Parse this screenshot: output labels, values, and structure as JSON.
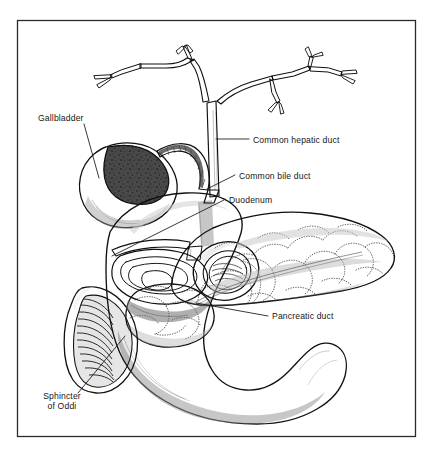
{
  "figure": {
    "kind": "anatomical-illustration",
    "style": "black-and-white pen-and-ink medical drawing with grayscale shading",
    "background_color": "#ffffff",
    "frame_color": "#2a2a2a",
    "ink_color": "#101010",
    "text_color": "#161616"
  },
  "labels": [
    {
      "id": "gallbladder",
      "text": "Gallbladder",
      "name": "label-gallbladder",
      "x": 38,
      "y": 121,
      "anchor": "start",
      "leader_from": [
        84,
        124
      ],
      "leader_to": [
        99,
        178
      ]
    },
    {
      "id": "common_hepatic_duct",
      "text": "Common hepatic duct",
      "name": "label-common-hepatic-duct",
      "x": 253,
      "y": 143,
      "anchor": "start",
      "leader_from": [
        249,
        139
      ],
      "leader_to": [
        216,
        139
      ]
    },
    {
      "id": "common_bile_duct",
      "text": "Common bile duct",
      "name": "label-common-bile-duct",
      "x": 239,
      "y": 179,
      "anchor": "start",
      "leader_from": [
        235,
        175
      ],
      "leader_to": [
        207,
        189
      ]
    },
    {
      "id": "duodenum",
      "text": "Duodenum",
      "name": "label-duodenum",
      "x": 229,
      "y": 203,
      "anchor": "start",
      "leader_from": [
        224,
        200
      ],
      "leader_to": [
        112,
        256
      ]
    },
    {
      "id": "pancreatic_duct",
      "text": "Pancreatic duct",
      "name": "label-pancreatic-duct",
      "x": 272,
      "y": 319,
      "anchor": "start",
      "leader_from": [
        268,
        316
      ],
      "leader_to": [
        196,
        303
      ]
    },
    {
      "id": "sphincter_of_oddi",
      "text": "Sphincter",
      "text_line2": "of Oddi",
      "name": "label-sphincter-of-oddi",
      "x": 62,
      "y": 399,
      "x2": 62,
      "y2": 409,
      "anchor": "middle",
      "leader_from": [
        78,
        393
      ],
      "leader_to": [
        125,
        336
      ]
    }
  ],
  "structures": [
    {
      "id": "hepatic-duct-tree",
      "name": "hepatic-duct-tree",
      "description": "Branching intrahepatic bile ducts converging to the common hepatic duct"
    },
    {
      "id": "gallbladder-body",
      "name": "gallbladder-body",
      "description": "Pear-shaped gallbladder, cut open to show dark granular interior"
    },
    {
      "id": "cystic-duct",
      "name": "cystic-duct",
      "description": "Curved cystic duct with spiral valves of Heister"
    },
    {
      "id": "common-bile-duct-tube",
      "name": "common-bile-duct-tube",
      "description": "Common bile duct descending into the duodenal wall"
    },
    {
      "id": "duodenum-body",
      "name": "duodenum-body",
      "description": "C-shaped duodenum, cut away to reveal lumen and ampulla"
    },
    {
      "id": "duodenum-lumen",
      "name": "duodenum-lumen",
      "description": "Open cut end of the duodenum showing circular mucosal folds"
    },
    {
      "id": "sphincter-folds",
      "name": "sphincter-folds",
      "description": "Ribbed plicae circulares at the sphincter of Oddi region"
    },
    {
      "id": "pancreas-body",
      "name": "pancreas-body",
      "description": "Lobulated pancreas extending to the left as head, body and tail"
    },
    {
      "id": "pancreatic-duct-line",
      "name": "pancreatic-duct-line",
      "description": "Main pancreatic duct running through the gland"
    }
  ]
}
